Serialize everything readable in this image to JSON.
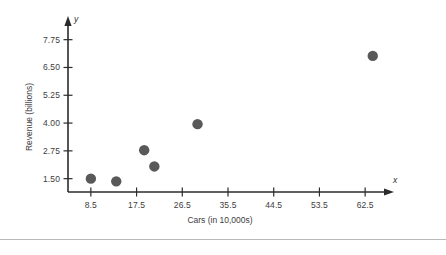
{
  "chart_data": {
    "type": "scatter",
    "title": "",
    "xlabel": "Cars (in 10,000s)",
    "ylabel": "Revenue (billions)",
    "x_axis_letter": "x",
    "y_axis_letter": "y",
    "xlim": [
      4.0,
      67.0
    ],
    "ylim": [
      0.9,
      8.05
    ],
    "xticks": [
      8.5,
      17.5,
      26.5,
      35.5,
      44.5,
      53.5,
      62.5
    ],
    "xtick_labels": [
      "8.5",
      "17.5",
      "26.5",
      "35.5",
      "44.5",
      "53.5",
      "62.5"
    ],
    "yticks": [
      1.5,
      2.75,
      4.0,
      5.25,
      6.5,
      7.75
    ],
    "ytick_labels": [
      "1.50",
      "2.75",
      "4.00",
      "5.25",
      "6.50",
      "7.75"
    ],
    "grid": false,
    "legend": null,
    "marker": "circle",
    "marker_color": "#595959",
    "marker_size": 5.2,
    "axis_color": "#2b2b2b",
    "points": [
      {
        "x": 8.5,
        "y": 1.5
      },
      {
        "x": 13.5,
        "y": 1.38
      },
      {
        "x": 19.0,
        "y": 2.78
      },
      {
        "x": 21.0,
        "y": 2.05
      },
      {
        "x": 29.5,
        "y": 3.95
      },
      {
        "x": 64.0,
        "y": 7.02
      }
    ]
  },
  "figure": {
    "background_color": "#ffffff",
    "divider_color": "#b9b9b9"
  }
}
